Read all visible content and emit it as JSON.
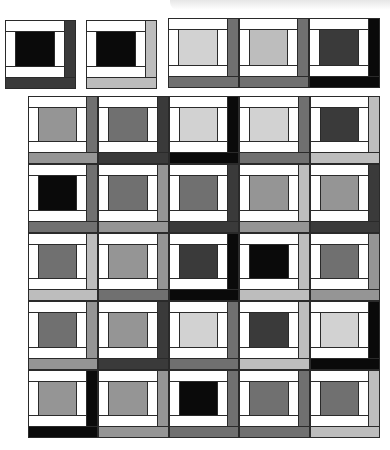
{
  "palette": {
    "K": "#0a0a0a",
    "D": "#3a3a3a",
    "M": "#707070",
    "G": "#959595",
    "L": "#bdbdbd",
    "P": "#d2d2d2"
  },
  "top_blocks": [
    {
      "x": 5,
      "y": 20,
      "w": 71,
      "h": 69,
      "center": "K",
      "right": "D",
      "bottom": "D"
    },
    {
      "x": 86,
      "y": 20,
      "w": 71,
      "h": 69,
      "center": "K",
      "right": "L",
      "bottom": "L"
    },
    {
      "x": 168,
      "y": 18,
      "w": 71,
      "h": 70,
      "center": "P",
      "right": "M",
      "bottom": "M"
    },
    {
      "x": 239,
      "y": 18,
      "w": 70,
      "h": 70,
      "center": "L",
      "right": "M",
      "bottom": "M"
    },
    {
      "x": 309,
      "y": 18,
      "w": 71,
      "h": 70,
      "center": "D",
      "right": "K",
      "bottom": "K"
    }
  ],
  "grid": {
    "x": 28,
    "y": 96,
    "cell_w": 70.4,
    "cell_h": 68.4,
    "cols": 5,
    "rows": 5,
    "cells": [
      [
        {
          "center": "G",
          "right": "M",
          "bottom": "G"
        },
        {
          "center": "M",
          "right": "D",
          "bottom": "D"
        },
        {
          "center": "P",
          "right": "K",
          "bottom": "K"
        },
        {
          "center": "P",
          "right": "M",
          "bottom": "M"
        },
        {
          "center": "D",
          "right": "L",
          "bottom": "L"
        }
      ],
      [
        {
          "center": "K",
          "right": "M",
          "bottom": "M"
        },
        {
          "center": "M",
          "right": "G",
          "bottom": "G"
        },
        {
          "center": "M",
          "right": "D",
          "bottom": "D"
        },
        {
          "center": "G",
          "right": "L",
          "bottom": "G"
        },
        {
          "center": "G",
          "right": "D",
          "bottom": "D"
        }
      ],
      [
        {
          "center": "M",
          "right": "L",
          "bottom": "L"
        },
        {
          "center": "G",
          "right": "G",
          "bottom": "M"
        },
        {
          "center": "D",
          "right": "K",
          "bottom": "K"
        },
        {
          "center": "K",
          "right": "L",
          "bottom": "L"
        },
        {
          "center": "M",
          "right": "G",
          "bottom": "G"
        }
      ],
      [
        {
          "center": "M",
          "right": "G",
          "bottom": "G"
        },
        {
          "center": "G",
          "right": "D",
          "bottom": "D"
        },
        {
          "center": "P",
          "right": "M",
          "bottom": "M"
        },
        {
          "center": "D",
          "right": "L",
          "bottom": "L"
        },
        {
          "center": "P",
          "right": "K",
          "bottom": "K"
        }
      ],
      [
        {
          "center": "G",
          "right": "K",
          "bottom": "K"
        },
        {
          "center": "G",
          "right": "G",
          "bottom": "G"
        },
        {
          "center": "K",
          "right": "M",
          "bottom": "M"
        },
        {
          "center": "M",
          "right": "M",
          "bottom": "M"
        },
        {
          "center": "M",
          "right": "L",
          "bottom": "L"
        }
      ]
    ]
  }
}
